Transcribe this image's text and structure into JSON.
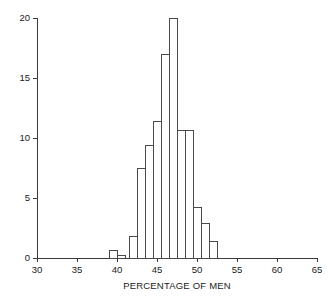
{
  "chart_data": {
    "type": "bar",
    "title": "",
    "subtitle": "",
    "xlabel": "PERCENTAGE OF MEN",
    "ylabel": "",
    "xlim": [
      30,
      65
    ],
    "ylim": [
      0,
      20
    ],
    "grid": false,
    "legend": "none",
    "bin_width": 1,
    "xticks": [
      30,
      35,
      40,
      45,
      50,
      55,
      60,
      65
    ],
    "xtick_labels": [
      "30",
      "35",
      "40",
      "45",
      "50",
      "55",
      "60",
      "65"
    ],
    "yticks": [
      0,
      5,
      10,
      15,
      20
    ],
    "ytick_labels": [
      "0",
      "5",
      "10",
      "15",
      "20"
    ],
    "bin_starts": [
      39,
      40,
      41.5,
      42.5,
      43.5,
      44.5,
      45.5,
      46.5,
      47.5,
      48.5,
      49.5,
      50.5,
      51.5
    ],
    "categories": [
      "39-40",
      "40-41",
      "41.5-42.5",
      "42.5-43.5",
      "43.5-44.5",
      "44.5-45.5",
      "45.5-46.5",
      "46.5-47.5",
      "47.5-48.5",
      "48.5-49.5",
      "49.5-50.5",
      "50.5-51.5",
      "51.5-52.5"
    ],
    "values": [
      0.6,
      0.25,
      1.8,
      7.5,
      9.4,
      11.4,
      17.0,
      20.0,
      10.6,
      10.6,
      4.2,
      2.9,
      1.4
    ],
    "annotations": []
  },
  "figure": {
    "axis_color": "#3a3a3a",
    "bar_edge_color": "#4a4a4a",
    "bar_fill_color": "#ffffff",
    "background_color": "#ffffff"
  }
}
